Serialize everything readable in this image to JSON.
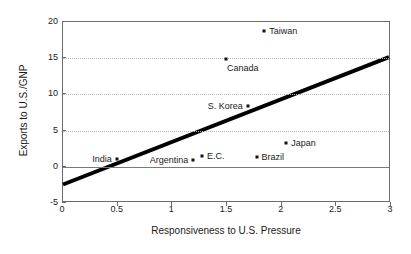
{
  "chart_data": {
    "type": "scatter",
    "title": "",
    "xlabel": "Responsiveness to U.S. Pressure",
    "ylabel": "Exports to U.S./GNP",
    "xlim": [
      0,
      3
    ],
    "ylim": [
      -5,
      20
    ],
    "xticks": [
      "0",
      "0.5",
      "1",
      "1.5",
      "2",
      "2.5",
      "3"
    ],
    "xtick_values": [
      0,
      0.5,
      1,
      1.5,
      2,
      2.5,
      3
    ],
    "yticks": [
      "20",
      "15",
      "10",
      "5",
      "0",
      "-5"
    ],
    "ytick_values": [
      20,
      15,
      10,
      5,
      0,
      -5
    ],
    "grid": "horizontal-dotted",
    "legend": "none",
    "points": [
      {
        "label": "Taiwan",
        "x": 1.85,
        "y": 18.6,
        "label_pos": "right"
      },
      {
        "label": "Canada",
        "x": 1.5,
        "y": 14.7,
        "label_pos": "below-right"
      },
      {
        "label": "S. Korea",
        "x": 1.7,
        "y": 8.2,
        "label_pos": "left"
      },
      {
        "label": "Japan",
        "x": 2.05,
        "y": 3.2,
        "label_pos": "right"
      },
      {
        "label": "E.C.",
        "x": 1.28,
        "y": 1.4,
        "label_pos": "right"
      },
      {
        "label": "Brazil",
        "x": 1.78,
        "y": 1.25,
        "label_pos": "right"
      },
      {
        "label": "Argentina",
        "x": 1.2,
        "y": 0.75,
        "label_pos": "left"
      },
      {
        "label": "India",
        "x": 0.5,
        "y": 0.95,
        "label_pos": "left"
      }
    ],
    "trend_line": {
      "name": "fitted-regression-line",
      "x_start": 0,
      "y_start": -2.7,
      "x_end": 3,
      "y_end": 15.1,
      "color": "#000000",
      "width_px": 4
    },
    "zero_reference_line": 0
  }
}
